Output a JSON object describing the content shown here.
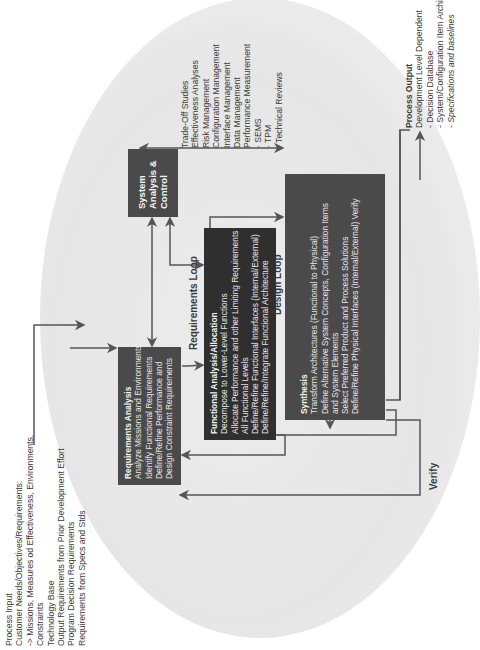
{
  "process_input": {
    "title": "Process Input",
    "lines": [
      "Customer Needs/Objectives/Requirements:",
      "-> Missions, Measures od Effectiveness, Environments,",
      "Constraints",
      "Technology Base",
      "Output Requirements from Prior Development Effort",
      "Program Decision Requirements",
      "Requirements from Specs and Stds"
    ]
  },
  "requirements_analysis": {
    "title": "Requirements Analysis",
    "lines": [
      "Analyze Missions and Environments",
      "Identify Functional Requirements",
      "Define/Refine Performance and",
      "Design Constraint Requirements"
    ]
  },
  "system_analysis_control": {
    "title_lines": [
      "System",
      "Analysis &",
      "Control"
    ]
  },
  "functional_analysis": {
    "title": "Functional Analysis/Allocation",
    "lines": [
      "Decompose to Lower-Level Functions",
      "Allocate Performance and other Limiting Requirements to",
      "All Functional Levels",
      "Define/Refine Functional Interfaces (Internal/External)",
      "Define/Refine/Integrate Functional Architecture"
    ]
  },
  "synthesis": {
    "title": "Synthesis",
    "lines": [
      "Transform Architectures (Functional to Physical)",
      "Define Alternative System Concepts, Configuration Items",
      "and System Elements",
      "Select Preferred Product and Process Solutions",
      "Define/Refine Physical Interfaces (Internal/External) Verify"
    ]
  },
  "control_tools": {
    "lines": [
      "Trade-Off Studies",
      "Effectiveness Analyses",
      "Risk Management",
      "Configuration Management",
      "Interface Management",
      "Data Management",
      "Performance Measurement",
      "  ·  SEMS",
      "  ·  TPM",
      "  ·  Technical Reviews"
    ]
  },
  "process_output": {
    "title": "Process Output",
    "lines": [
      "Development Level Dependent",
      "  -  Decision Database",
      "  -  System/Configuration Item Architecture",
      "  -  Specifications and baselines"
    ]
  },
  "loops": {
    "requirements_loop": "Requirements Loop",
    "design_loop": "Design Loop",
    "verify": "Verify"
  },
  "colors": {
    "dark_box": "#2f2f2f",
    "mid_box": "#4a4a4a",
    "ellipse": "#e6e6e6",
    "lines": "#555555"
  }
}
